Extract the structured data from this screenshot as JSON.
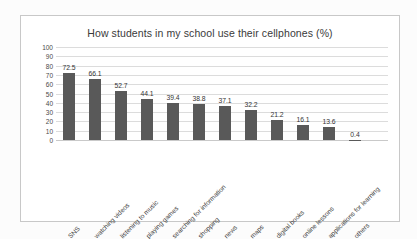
{
  "chart_data": {
    "type": "bar",
    "title": "How students in my school use their cellphones (%)",
    "xlabel": "",
    "ylabel": "",
    "ylim": [
      0,
      100
    ],
    "ytick_step": 10,
    "yticks": [
      100,
      90,
      80,
      70,
      60,
      50,
      40,
      30,
      20,
      10,
      0
    ],
    "grid": true,
    "legend": false,
    "bar_color": "#595959",
    "gridline_color": "#dcdcdc",
    "categories": [
      "SNS",
      "watching videos",
      "listening to music",
      "playing games",
      "searching for information",
      "shopping",
      "news",
      "maps",
      "digital books",
      "online lessons",
      "applications for learning",
      "others"
    ],
    "values": [
      72.5,
      66.1,
      52.7,
      44.1,
      39.4,
      38.8,
      37.1,
      32.2,
      21.2,
      16.1,
      13.6,
      0.4
    ],
    "value_labels": [
      "72.5",
      "66.1",
      "52.7",
      "44.1",
      "39.4",
      "38.8",
      "37.1",
      "32.2",
      "21.2",
      "16.1",
      "13.6",
      "0.4"
    ]
  }
}
